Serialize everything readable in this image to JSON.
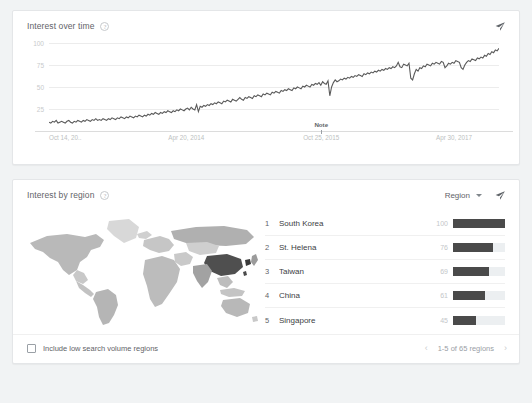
{
  "interest_over_time": {
    "title": "Interest over time",
    "help_icon": "help-circle-icon",
    "share_icon": "share-icon",
    "y_ticks": [
      "100",
      "75",
      "50",
      "25"
    ],
    "x_ticks": [
      "Oct 14, 20..",
      "Apr 20, 2014",
      "Oct 25, 2015",
      "Apr 30, 2017"
    ],
    "note_label": "Note"
  },
  "interest_by_region": {
    "title": "Interest by region",
    "help_icon": "help-circle-icon",
    "region_dropdown_label": "Region",
    "dropdown_icon": "chevron-down-icon",
    "share_icon": "share-icon",
    "map_icon": "world-map",
    "rows": [
      {
        "rank": "1",
        "name": "South Korea",
        "value": "100",
        "pct": 100
      },
      {
        "rank": "2",
        "name": "St. Helena",
        "value": "76",
        "pct": 76
      },
      {
        "rank": "3",
        "name": "Taiwan",
        "value": "69",
        "pct": 69
      },
      {
        "rank": "4",
        "name": "China",
        "value": "61",
        "pct": 61
      },
      {
        "rank": "5",
        "name": "Singapore",
        "value": "45",
        "pct": 45
      }
    ],
    "include_low_volume_label": "Include low search volume regions",
    "pagination": {
      "prev_icon": "chevron-left-icon",
      "text": "1-5 of 65 regions",
      "next_icon": "chevron-right-icon"
    }
  },
  "chart_data": {
    "type": "line",
    "title": "Interest over time",
    "xlabel": "",
    "ylabel": "",
    "ylim": [
      0,
      100
    ],
    "y_gridlines": [
      100,
      75,
      50,
      25
    ],
    "x_tick_labels": [
      "Oct 14, 20..",
      "Apr 20, 2014",
      "Oct 25, 2015",
      "Apr 30, 2017"
    ],
    "x_tick_positions_pct": [
      0,
      30.5,
      60.5,
      90
    ],
    "annotations": [
      {
        "label": "Note",
        "x_pct": 60.5
      }
    ],
    "series": [
      {
        "name": "Search interest",
        "values": [
          10,
          9,
          11,
          10,
          12,
          9,
          10,
          11,
          10,
          9,
          11,
          12,
          10,
          9,
          11,
          10,
          12,
          11,
          10,
          12,
          11,
          13,
          12,
          11,
          13,
          12,
          14,
          12,
          13,
          12,
          14,
          13,
          12,
          14,
          13,
          15,
          14,
          13,
          15,
          14,
          16,
          15,
          14,
          16,
          15,
          17,
          16,
          15,
          17,
          16,
          18,
          17,
          16,
          18,
          17,
          19,
          18,
          20,
          19,
          21,
          20,
          19,
          21,
          20,
          22,
          21,
          23,
          22,
          21,
          23,
          22,
          24,
          23,
          25,
          24,
          23,
          25,
          26,
          24,
          27,
          25,
          24,
          30,
          22,
          28,
          27,
          29,
          28,
          30,
          29,
          31,
          30,
          32,
          31,
          33,
          32,
          31,
          34,
          33,
          35,
          34,
          33,
          36,
          35,
          34,
          36,
          38,
          36,
          35,
          38,
          37,
          39,
          38,
          37,
          40,
          39,
          41,
          40,
          39,
          42,
          41,
          43,
          42,
          41,
          44,
          43,
          45,
          44,
          43,
          46,
          45,
          47,
          46,
          48,
          47,
          46,
          49,
          48,
          50,
          49,
          48,
          51,
          50,
          52,
          51,
          50,
          53,
          52,
          54,
          53,
          55,
          52,
          56,
          54,
          53,
          57,
          40,
          50,
          55,
          58,
          56,
          57,
          59,
          58,
          60,
          59,
          61,
          60,
          62,
          61,
          63,
          62,
          64,
          63,
          62,
          65,
          64,
          66,
          65,
          67,
          66,
          68,
          67,
          69,
          68,
          70,
          69,
          71,
          70,
          72,
          71,
          73,
          72,
          74,
          78,
          73,
          72,
          76,
          75,
          74,
          77,
          60,
          58,
          65,
          70,
          68,
          72,
          71,
          74,
          73,
          76,
          75,
          74,
          77,
          76,
          78,
          77,
          76,
          79,
          78,
          72,
          74,
          77,
          76,
          78,
          77,
          80,
          79,
          78,
          72,
          70,
          75,
          78,
          80,
          79,
          82,
          81,
          80,
          83,
          82,
          84,
          83,
          86,
          85,
          88,
          87,
          90,
          89,
          92,
          91,
          94
        ]
      }
    ]
  }
}
